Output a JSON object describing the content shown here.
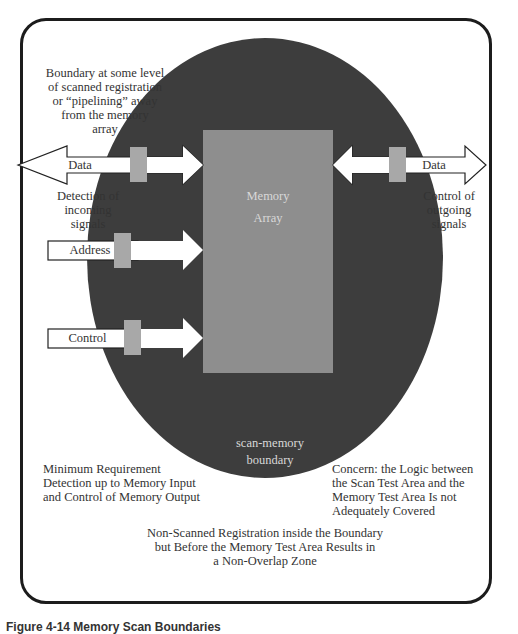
{
  "figure": {
    "caption": "Figure 4-14 Memory Scan Boundaries"
  },
  "annotations": {
    "boundary_note": [
      "Boundary at some level",
      "of scanned registration",
      "or “pipelining” away",
      "from the memory",
      "array"
    ],
    "detection_note": [
      "Detection of",
      "incoming",
      "signals"
    ],
    "control_note": [
      "Control of",
      "outgoing",
      "signals"
    ],
    "min_requirement": [
      "Minimum Requirement",
      "Detection up to Memory Input",
      "and Control of Memory Output"
    ],
    "concern": [
      "Concern: the Logic between",
      "the Scan Test Area and the",
      "Memory Test Area Is not",
      "Adequately Covered"
    ],
    "non_scanned": [
      "Non-Scanned Registration inside the Boundary",
      "but Before the Memory Test Area Results in",
      "a Non-Overlap Zone"
    ]
  },
  "memory_array": {
    "line1": "Memory",
    "line2": "Array"
  },
  "boundary_label": {
    "line1": "scan-memory",
    "line2": "boundary"
  },
  "signals": {
    "data_in_out": "Data",
    "address": "Address",
    "control": "Control",
    "data_out": "Data"
  },
  "colors": {
    "ellipse": "#3d3d3d",
    "memory_array": "#8e8e8e",
    "register_block": "#a8a8a8",
    "frame": "#1c1c1c"
  }
}
